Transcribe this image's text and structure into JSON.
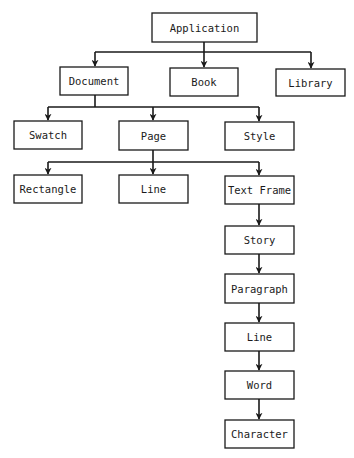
{
  "diagram": {
    "type": "hierarchy",
    "colors": {
      "stroke": "#1a1a1a",
      "fill": "#ffffff",
      "text": "#1a1a1a"
    },
    "nodes": {
      "application": {
        "label": "Application"
      },
      "document": {
        "label": "Document"
      },
      "book": {
        "label": "Book"
      },
      "library": {
        "label": "Library"
      },
      "swatch": {
        "label": "Swatch"
      },
      "page": {
        "label": "Page"
      },
      "style": {
        "label": "Style"
      },
      "rectangle": {
        "label": "Rectangle"
      },
      "line_shape": {
        "label": "Line"
      },
      "text_frame": {
        "label": "Text Frame"
      },
      "story": {
        "label": "Story"
      },
      "paragraph": {
        "label": "Paragraph"
      },
      "line_text": {
        "label": "Line"
      },
      "word": {
        "label": "Word"
      },
      "character": {
        "label": "Character"
      }
    },
    "edges": [
      [
        "Application",
        "Document"
      ],
      [
        "Application",
        "Book"
      ],
      [
        "Application",
        "Library"
      ],
      [
        "Document",
        "Swatch"
      ],
      [
        "Document",
        "Page"
      ],
      [
        "Document",
        "Style"
      ],
      [
        "Page",
        "Rectangle"
      ],
      [
        "Page",
        "Line"
      ],
      [
        "Page",
        "Text Frame"
      ],
      [
        "Text Frame",
        "Story"
      ],
      [
        "Story",
        "Paragraph"
      ],
      [
        "Paragraph",
        "Line"
      ],
      [
        "Line",
        "Word"
      ],
      [
        "Word",
        "Character"
      ]
    ]
  }
}
